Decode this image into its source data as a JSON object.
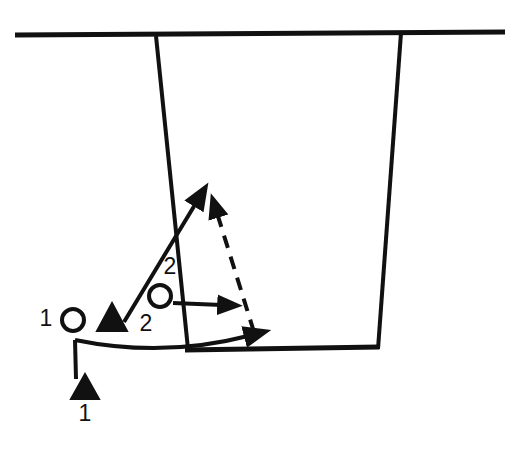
{
  "diagram": {
    "background_color": "#ffffff",
    "ink_color": "#111111",
    "width": 505,
    "height": 458,
    "field_lines": {
      "name": "pitch-markings",
      "stroke_color": "#111111",
      "top_line": {
        "name": "top-touchline",
        "x1": 15,
        "y1": 35,
        "x2": 505,
        "y2": 32,
        "width": 5
      },
      "left_post_line": {
        "name": "left-vertical-line",
        "x1": 156,
        "y1": 36,
        "x2": 188,
        "y2": 349,
        "width": 4
      },
      "right_post_line": {
        "name": "right-vertical-line",
        "x1": 401,
        "y1": 33,
        "x2": 378,
        "y2": 349,
        "width": 4
      },
      "bottom_line": {
        "name": "bottom-goal-line",
        "x1": 186,
        "y1": 350,
        "x2": 378,
        "y2": 347,
        "width": 5
      }
    },
    "players": [
      {
        "id": "attacker-1",
        "marker": "circle",
        "marker_style": "open",
        "label": "1",
        "label_position": "left",
        "cx": 73,
        "cy": 320,
        "r": 11,
        "label_x": 45,
        "label_y": 318
      },
      {
        "id": "defender-1",
        "marker": "triangle",
        "marker_style": "filled",
        "label": "",
        "label_position": "none",
        "cx": 112,
        "cy": 320,
        "size": 15,
        "label_x": 0,
        "label_y": 0
      },
      {
        "id": "attacker-2",
        "marker": "circle",
        "marker_style": "open",
        "label": "2",
        "label_position": "above",
        "cx": 160,
        "cy": 296,
        "r": 11,
        "label_x": 169,
        "label_y": 266
      },
      {
        "id": "defender-2",
        "marker": "triangle-label",
        "marker_style": "text-only",
        "label": "2",
        "label_position": "right-of-triangle",
        "cx": 0,
        "cy": 0,
        "size": 0,
        "label_x": 145,
        "label_y": 325
      },
      {
        "id": "defender-1-start",
        "marker": "triangle",
        "marker_style": "filled",
        "label": "1",
        "label_position": "below",
        "cx": 85,
        "cy": 388,
        "size": 14,
        "label_x": 85,
        "label_y": 415
      }
    ],
    "movement_paths": [
      {
        "id": "run-defender-2-up",
        "style": "solid",
        "arrowhead": true,
        "description": "diagonal run up and to the right",
        "path": "M 124 322 L 200 200"
      },
      {
        "id": "pass-attacker-2-right",
        "style": "solid",
        "arrowhead": true,
        "description": "short horizontal pass to the right",
        "path": "M 173 303 L 228 305"
      },
      {
        "id": "dashed-cut-back",
        "style": "dashed",
        "arrowhead": true,
        "description": "dashed supporting line running up and left",
        "path": "M 254 332 L 214 207"
      },
      {
        "id": "curved-run-from-1",
        "style": "solid-curve",
        "arrowhead": true,
        "description": "long curved run from deep position out to the right",
        "path": "M 75 340 Q 160 356 252 336"
      },
      {
        "id": "stem-from-defender-1-start",
        "style": "solid",
        "arrowhead": false,
        "description": "vertical stem rising from the deep defender marker",
        "path": "M 75 378 L 75 339"
      }
    ],
    "legend_labels": [
      "1",
      "2",
      "2",
      "1"
    ]
  }
}
